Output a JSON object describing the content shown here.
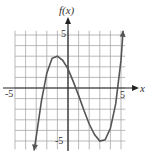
{
  "chart_data": {
    "type": "line",
    "title": "",
    "xlabel": "x",
    "ylabel": "f(x)",
    "xlim": [
      -5,
      5
    ],
    "ylim": [
      -6,
      6
    ],
    "grid": true,
    "x_tick_labels": [
      "-5",
      "5"
    ],
    "y_tick_labels": [
      "5",
      "-5"
    ],
    "series": [
      {
        "name": "f(x)",
        "x": [
          -3.2,
          -3,
          -2.5,
          -2,
          -1.5,
          -1,
          -0.5,
          0,
          0.5,
          1,
          1.5,
          2,
          2.5,
          3,
          3.5,
          4,
          4.5,
          5,
          5.2
        ],
        "y": [
          -5.9,
          -4.6,
          -1.2,
          1.4,
          2.8,
          3.0,
          2.6,
          1.8,
          0.6,
          -0.7,
          -2.1,
          -3.4,
          -4.4,
          -5.0,
          -4.9,
          -3.8,
          -1.5,
          2.6,
          5.4
        ]
      }
    ],
    "annotations": {
      "y_axis_label": "f(x)",
      "x_axis_label": "x",
      "x_min_label": "-5",
      "x_max_label": "5",
      "y_max_label": "5",
      "y_min_label": "-5"
    }
  },
  "colors": {
    "grid": "#9a9a9a",
    "axes": "#222222",
    "curve": "#555555"
  }
}
